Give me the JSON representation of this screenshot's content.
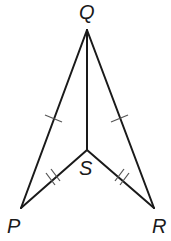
{
  "diagram": {
    "type": "geometry-figure",
    "colors": {
      "stroke": "#1a1a1a",
      "tick": "#555555",
      "background": "#ffffff"
    },
    "points": {
      "Q": {
        "label": "Q",
        "x": 87,
        "y": 30
      },
      "S": {
        "label": "S",
        "x": 87,
        "y": 150
      },
      "P": {
        "label": "P",
        "x": 21,
        "y": 208
      },
      "R": {
        "label": "R",
        "x": 154,
        "y": 208
      }
    },
    "segments": [
      {
        "from": "Q",
        "to": "P",
        "ticks": 1
      },
      {
        "from": "Q",
        "to": "R",
        "ticks": 1
      },
      {
        "from": "Q",
        "to": "S",
        "ticks": 0
      },
      {
        "from": "P",
        "to": "S",
        "ticks": 2
      },
      {
        "from": "R",
        "to": "S",
        "ticks": 2
      }
    ],
    "labels": {
      "Q": "Q",
      "S": "S",
      "P": "P",
      "R": "R"
    }
  }
}
